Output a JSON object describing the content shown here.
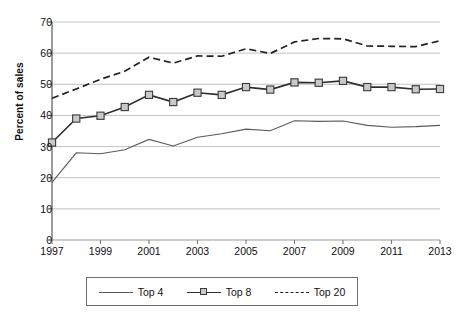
{
  "chart_data": {
    "type": "line",
    "title": "",
    "xlabel": "",
    "ylabel": "Percent of sales",
    "x": [
      1997,
      1998,
      1999,
      2000,
      2001,
      2002,
      2003,
      2004,
      2005,
      2006,
      2007,
      2008,
      2009,
      2010,
      2011,
      2012,
      2013
    ],
    "xlim": [
      1997,
      2013
    ],
    "ylim": [
      0,
      70
    ],
    "ytick_values": [
      0,
      10,
      20,
      30,
      40,
      50,
      60,
      70
    ],
    "ytick_labels": [
      "0",
      "10",
      "20",
      "30",
      "40",
      "50",
      "60",
      "70"
    ],
    "xtick_values": [
      1997,
      1999,
      2001,
      2003,
      2005,
      2007,
      2009,
      2011,
      2013
    ],
    "xtick_labels": [
      "1997",
      "1999",
      "2001",
      "2003",
      "2005",
      "2007",
      "2009",
      "2011",
      "2013"
    ],
    "grid": "horizontal",
    "legend_position": "bottom",
    "series": [
      {
        "name": "Top 4",
        "style": "solid",
        "marker": "none",
        "color": "#5a5a5a",
        "values": [
          18.5,
          28.0,
          27.7,
          29.0,
          32.3,
          30.2,
          33.0,
          34.1,
          35.6,
          35.1,
          38.3,
          38.1,
          38.2,
          36.8,
          36.2,
          36.4,
          36.8
        ]
      },
      {
        "name": "Top 8",
        "style": "solid",
        "marker": "square",
        "color": "#2e2e2e",
        "marker_fill": "#c9c9c9",
        "values": [
          31.3,
          39.0,
          39.9,
          42.7,
          46.6,
          44.3,
          47.3,
          46.6,
          49.1,
          48.3,
          50.6,
          50.5,
          51.1,
          49.1,
          49.1,
          48.4,
          48.5
        ]
      },
      {
        "name": "Top 20",
        "style": "dashed",
        "marker": "none",
        "color": "#222222",
        "values": [
          45.5,
          48.5,
          51.6,
          54.2,
          58.7,
          56.8,
          59.1,
          59.0,
          61.4,
          59.9,
          63.6,
          64.7,
          64.6,
          62.3,
          62.2,
          62.1,
          64.0
        ]
      }
    ]
  },
  "legend": {
    "items": [
      {
        "label": "Top 4"
      },
      {
        "label": "Top 8"
      },
      {
        "label": "Top 20"
      }
    ]
  }
}
